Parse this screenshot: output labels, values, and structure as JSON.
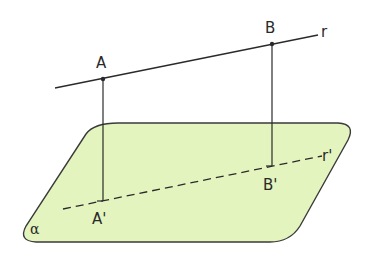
{
  "diagram": {
    "colors": {
      "plane_fill": "#e3f4bf",
      "stroke": "#3a3a3a",
      "background": "#ffffff"
    },
    "labels": {
      "point_a": "A",
      "point_b": "B",
      "line_r": "r",
      "point_a_proj": "A'",
      "point_b_proj": "B'",
      "line_r_proj": "r'",
      "plane": "α"
    }
  }
}
